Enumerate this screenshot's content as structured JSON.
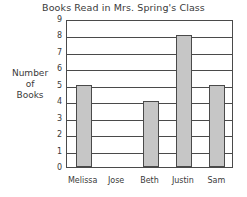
{
  "chart_data": {
    "type": "bar",
    "title": "Books Read in Mrs. Spring's Class",
    "xlabel": "",
    "ylabel": "Number of Books",
    "ylabel_lines": [
      "Number",
      "of",
      "Books"
    ],
    "categories": [
      "Melissa",
      "Jose",
      "Beth",
      "Justin",
      "Sam"
    ],
    "values": [
      5,
      0,
      4,
      8,
      5
    ],
    "ylim": [
      0,
      9
    ],
    "ytick_labels": [
      "0",
      "1",
      "2",
      "3",
      "4",
      "5",
      "6",
      "7",
      "8",
      "9"
    ],
    "ytick_values": [
      0,
      1,
      2,
      3,
      4,
      5,
      6,
      7,
      8,
      9
    ],
    "grid": "horizontal",
    "legend": "none",
    "bar_color": "#c6c6c6",
    "bar_edge_color": "#4a4a4a",
    "axis_color": "#4a4a4a",
    "background_color": "#ffffff"
  }
}
